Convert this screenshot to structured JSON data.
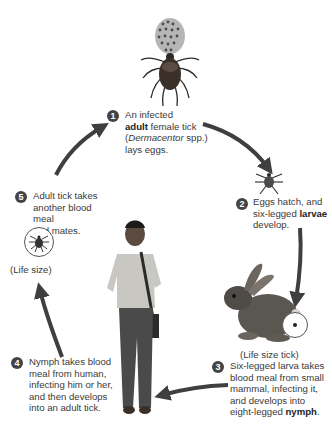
{
  "diagram": {
    "steps": [
      {
        "number": "1",
        "parts": [
          "An infected",
          "adult",
          " female tick",
          "(",
          "Dermacentor",
          " spp.)",
          "lays eggs."
        ]
      },
      {
        "number": "2",
        "parts": [
          "Eggs hatch, and",
          "six-legged ",
          "larvae",
          "develop."
        ]
      },
      {
        "number": "3",
        "parts": [
          "Six-legged larva takes",
          "blood meal from small",
          "mammal, infecting it,",
          "and develops into",
          "eight-legged ",
          "nymph",
          "."
        ]
      },
      {
        "number": "4",
        "parts": [
          "Nymph takes blood",
          "meal from human,",
          "infecting him or her,",
          "and then develops",
          "into an adult tick."
        ]
      },
      {
        "number": "5",
        "parts": [
          "Adult tick takes",
          "another blood meal",
          "and mates."
        ]
      }
    ],
    "captions": {
      "life_size": "(Life size)",
      "life_size_tick": "(Life size tick)"
    },
    "illustrations": {
      "adult_tick_with_eggs": "adult-tick-laying-eggs",
      "larva": "six-legged-larva",
      "rabbit": "rabbit-small-mammal",
      "human": "young-man-walking",
      "life_size_adult": "life-size-adult-tick-circle",
      "life_size_tick": "life-size-nymph-tick-circle"
    },
    "colors": {
      "arrow": "#3f3f3f",
      "badge": "#444444",
      "text": "#3a3a3a"
    }
  }
}
